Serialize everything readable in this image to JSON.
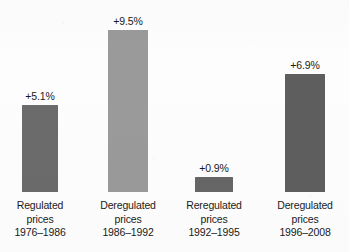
{
  "chart_data": {
    "type": "bar",
    "title": "",
    "subtitle": "",
    "xlabel": "",
    "ylabel": "",
    "ylim": [
      0,
      10
    ],
    "grid": false,
    "legend": null,
    "categories": [
      "Regulated prices 1976-1986",
      "Deregulated prices 1986-1992",
      "Reregulated prices 1992-1995",
      "Deregulated prices 1996-2008"
    ],
    "values": [
      5.1,
      9.5,
      0.9,
      6.9
    ],
    "value_labels": [
      "+5.1%",
      "+9.5%",
      "+0.9%",
      "+6.9%"
    ],
    "bars": [
      {
        "value": 5.1,
        "value_label": "+5.1%",
        "color": "#6b6b6b",
        "caption_lines": [
          "Regulated",
          "prices",
          "1976–1986"
        ]
      },
      {
        "value": 9.5,
        "value_label": "+9.5%",
        "color": "#9a9a9a",
        "caption_lines": [
          "Deregulated",
          "prices",
          "1986–1992"
        ]
      },
      {
        "value": 0.9,
        "value_label": "+0.9%",
        "color": "#666666",
        "caption_lines": [
          "Reregulated",
          "prices",
          "1992–1995"
        ]
      },
      {
        "value": 6.9,
        "value_label": "+6.9%",
        "color": "#5e5e5e",
        "caption_lines": [
          "Deregulated",
          "prices",
          "1996–2008"
        ]
      }
    ],
    "colors": {
      "background": "#fdfdfd",
      "text": "#1a1a1a",
      "bar_1": "#6b6b6b",
      "bar_2": "#9a9a9a",
      "bar_3": "#666666",
      "bar_4": "#5e5e5e"
    }
  }
}
